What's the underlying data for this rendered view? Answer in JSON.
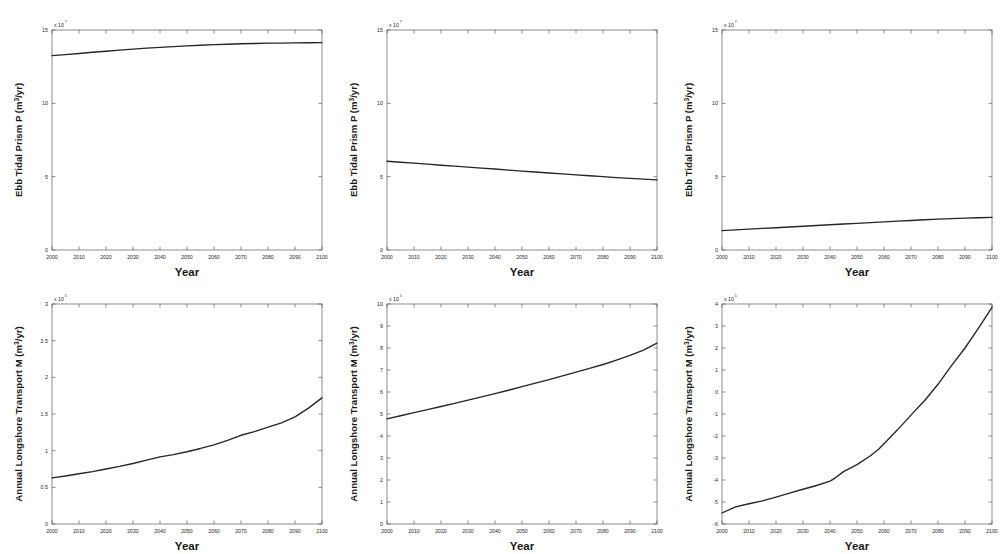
{
  "figure": {
    "background": "#ffffff",
    "line_color": "#262626",
    "axis_color": "#5c5c5c",
    "rows": 2,
    "cols": 3,
    "panel_count": 6
  },
  "chart_data": [
    {
      "id": "panel-top-left",
      "type": "line",
      "title": "",
      "xlabel": "Year",
      "ylabel": "Ebb Tidal Prism P (m³/yr)",
      "ylabel_base": "Ebb Tidal Prism P (m",
      "ylabel_sup": "3",
      "ylabel_tail": "/yr)",
      "y_exponent_prefix": "x 10",
      "y_exponent": "7",
      "xlim": [
        2000,
        2100
      ],
      "ylim": [
        0,
        15
      ],
      "grid": false,
      "legend": "none",
      "xticks": [
        2000,
        2010,
        2020,
        2030,
        2040,
        2050,
        2060,
        2070,
        2080,
        2090,
        2100
      ],
      "xticklabels": [
        "2000",
        "2010",
        "2020",
        "2030",
        "2040",
        "2050",
        "2060",
        "2070",
        "2080",
        "2090",
        "2100"
      ],
      "yticks": [
        0,
        5,
        10,
        15
      ],
      "yticklabels": [
        "0",
        "5",
        "10",
        "15"
      ],
      "x": [
        2000,
        2005,
        2010,
        2015,
        2020,
        2025,
        2030,
        2035,
        2040,
        2045,
        2050,
        2055,
        2060,
        2065,
        2070,
        2075,
        2080,
        2085,
        2090,
        2095,
        2100
      ],
      "values": [
        13.25,
        13.32,
        13.4,
        13.48,
        13.55,
        13.63,
        13.7,
        13.76,
        13.82,
        13.87,
        13.92,
        13.96,
        14.0,
        14.03,
        14.06,
        14.08,
        14.1,
        14.11,
        14.12,
        14.13,
        14.14
      ]
    },
    {
      "id": "panel-top-mid",
      "type": "line",
      "title": "",
      "xlabel": "Year",
      "ylabel": "Ebb Tidal Prism P (m³/yr)",
      "ylabel_base": "Ebb Tidal Prism P (m",
      "ylabel_sup": "3",
      "ylabel_tail": "/yr)",
      "y_exponent_prefix": "x 10",
      "y_exponent": "7",
      "xlim": [
        2000,
        2100
      ],
      "ylim": [
        0,
        15
      ],
      "grid": false,
      "legend": "none",
      "xticks": [
        2000,
        2010,
        2020,
        2030,
        2040,
        2050,
        2060,
        2070,
        2080,
        2090,
        2100
      ],
      "xticklabels": [
        "2000",
        "2010",
        "2020",
        "2030",
        "2040",
        "2050",
        "2060",
        "2070",
        "2080",
        "2090",
        "2100"
      ],
      "yticks": [
        0,
        5,
        10,
        15
      ],
      "yticklabels": [
        "0",
        "5",
        "10",
        "15"
      ],
      "x": [
        2000,
        2005,
        2010,
        2015,
        2020,
        2025,
        2030,
        2035,
        2040,
        2045,
        2050,
        2055,
        2060,
        2065,
        2070,
        2075,
        2080,
        2085,
        2090,
        2095,
        2100
      ],
      "values": [
        6.05,
        5.98,
        5.92,
        5.85,
        5.78,
        5.72,
        5.65,
        5.58,
        5.52,
        5.45,
        5.38,
        5.32,
        5.25,
        5.19,
        5.12,
        5.06,
        5.0,
        4.94,
        4.88,
        4.83,
        4.78
      ]
    },
    {
      "id": "panel-top-right",
      "type": "line",
      "title": "",
      "xlabel": "Year",
      "ylabel": "Ebb Tidal Prism P (m³/yr)",
      "ylabel_base": "Ebb Tidal Prism P (m",
      "ylabel_sup": "3",
      "ylabel_tail": "/yr)",
      "y_exponent_prefix": "x 10",
      "y_exponent": "7",
      "xlim": [
        2000,
        2100
      ],
      "ylim": [
        0,
        15
      ],
      "grid": false,
      "legend": "none",
      "xticks": [
        2000,
        2010,
        2020,
        2030,
        2040,
        2050,
        2060,
        2070,
        2080,
        2090,
        2100
      ],
      "xticklabels": [
        "2000",
        "2010",
        "2020",
        "2030",
        "2040",
        "2050",
        "2060",
        "2070",
        "2080",
        "2090",
        "2100"
      ],
      "yticks": [
        0,
        5,
        10,
        15
      ],
      "yticklabels": [
        "0",
        "5",
        "10",
        "15"
      ],
      "x": [
        2000,
        2005,
        2010,
        2015,
        2020,
        2025,
        2030,
        2035,
        2040,
        2045,
        2050,
        2055,
        2060,
        2065,
        2070,
        2075,
        2080,
        2085,
        2090,
        2095,
        2100
      ],
      "values": [
        1.32,
        1.37,
        1.42,
        1.47,
        1.52,
        1.57,
        1.62,
        1.67,
        1.72,
        1.77,
        1.82,
        1.87,
        1.92,
        1.97,
        2.01,
        2.06,
        2.1,
        2.14,
        2.17,
        2.2,
        2.22
      ]
    },
    {
      "id": "panel-bottom-left",
      "type": "line",
      "title": "",
      "xlabel": "Year",
      "ylabel": "Annual Longshore Transport M (m³/yr)",
      "ylabel_base": "Annual Longshore Transport M (m",
      "ylabel_sup": "3",
      "ylabel_tail": "/yr)",
      "y_exponent_prefix": "x 10",
      "y_exponent": "5",
      "xlim": [
        2000,
        2100
      ],
      "ylim": [
        0,
        3
      ],
      "grid": false,
      "legend": "none",
      "xticks": [
        2000,
        2010,
        2020,
        2030,
        2040,
        2050,
        2060,
        2070,
        2080,
        2090,
        2100
      ],
      "xticklabels": [
        "2000",
        "2010",
        "2020",
        "2030",
        "2040",
        "2050",
        "2060",
        "2070",
        "2080",
        "2090",
        "2100"
      ],
      "yticks": [
        0,
        0.5,
        1,
        1.5,
        2,
        2.5,
        3
      ],
      "yticklabels": [
        "0",
        "0.5",
        "1",
        "1.5",
        "2",
        "2.5",
        "3"
      ],
      "x": [
        2000,
        2005,
        2010,
        2015,
        2020,
        2025,
        2030,
        2035,
        2040,
        2045,
        2050,
        2055,
        2060,
        2065,
        2070,
        2075,
        2080,
        2085,
        2090,
        2095,
        2100
      ],
      "values": [
        0.63,
        0.655,
        0.685,
        0.715,
        0.75,
        0.785,
        0.825,
        0.87,
        0.915,
        0.945,
        0.985,
        1.03,
        1.08,
        1.14,
        1.21,
        1.26,
        1.32,
        1.38,
        1.46,
        1.58,
        1.72
      ]
    },
    {
      "id": "panel-bottom-mid",
      "type": "line",
      "title": "",
      "xlabel": "Year",
      "ylabel": "Annual Longshore Transport M (m³/yr)",
      "ylabel_base": "Annual Longshore Transport M (m",
      "ylabel_sup": "3",
      "ylabel_tail": "/yr)",
      "y_exponent_prefix": "x 10",
      "y_exponent": "5",
      "xlim": [
        2000,
        2100
      ],
      "ylim": [
        0,
        10
      ],
      "grid": false,
      "legend": "none",
      "xticks": [
        2000,
        2010,
        2020,
        2030,
        2040,
        2050,
        2060,
        2070,
        2080,
        2090,
        2100
      ],
      "xticklabels": [
        "2000",
        "2010",
        "2020",
        "2030",
        "2040",
        "2050",
        "2060",
        "2070",
        "2080",
        "2090",
        "2100"
      ],
      "yticks": [
        0,
        1,
        2,
        3,
        4,
        5,
        6,
        7,
        8,
        9,
        10
      ],
      "yticklabels": [
        "0",
        "1",
        "2",
        "3",
        "4",
        "5",
        "6",
        "7",
        "8",
        "9",
        "10"
      ],
      "x": [
        2000,
        2005,
        2010,
        2015,
        2020,
        2025,
        2030,
        2035,
        2040,
        2045,
        2050,
        2055,
        2060,
        2065,
        2070,
        2075,
        2080,
        2085,
        2090,
        2095,
        2100
      ],
      "values": [
        4.78,
        4.92,
        5.06,
        5.2,
        5.34,
        5.48,
        5.63,
        5.78,
        5.93,
        6.08,
        6.24,
        6.4,
        6.56,
        6.73,
        6.9,
        7.07,
        7.25,
        7.45,
        7.66,
        7.9,
        8.22
      ]
    },
    {
      "id": "panel-bottom-right",
      "type": "line",
      "title": "",
      "xlabel": "Year",
      "ylabel": "Annual Longshore Transport M (m³/yr)",
      "ylabel_base": "Annual Longshore Transport M (m",
      "ylabel_sup": "3",
      "ylabel_tail": "/yr)",
      "y_exponent_prefix": "x 10",
      "y_exponent": "5",
      "xlim": [
        2000,
        2100
      ],
      "ylim": [
        -6,
        4
      ],
      "grid": false,
      "legend": "none",
      "xticks": [
        2000,
        2010,
        2020,
        2030,
        2040,
        2050,
        2060,
        2070,
        2080,
        2090,
        2100
      ],
      "xticklabels": [
        "2000",
        "2010",
        "2020",
        "2030",
        "2040",
        "2050",
        "2060",
        "2070",
        "2080",
        "2090",
        "2100"
      ],
      "yticks": [
        -6,
        -5,
        -4,
        -3,
        -2,
        -1,
        0,
        1,
        2,
        3,
        4
      ],
      "yticklabels": [
        "-6",
        "-5",
        "-4",
        "-3",
        "-2",
        "-1",
        "0",
        "1",
        "2",
        "3",
        "4"
      ],
      "x": [
        2000,
        2005,
        2010,
        2015,
        2020,
        2025,
        2030,
        2035,
        2040,
        2042,
        2045,
        2050,
        2055,
        2058,
        2060,
        2065,
        2070,
        2072,
        2075,
        2080,
        2085,
        2090,
        2095,
        2100
      ],
      "values": [
        -5.5,
        -5.22,
        -5.08,
        -4.95,
        -4.78,
        -4.6,
        -4.42,
        -4.25,
        -4.05,
        -3.9,
        -3.62,
        -3.3,
        -2.9,
        -2.6,
        -2.35,
        -1.72,
        -1.05,
        -0.78,
        -0.4,
        0.35,
        1.2,
        2.0,
        2.9,
        3.85
      ]
    }
  ]
}
